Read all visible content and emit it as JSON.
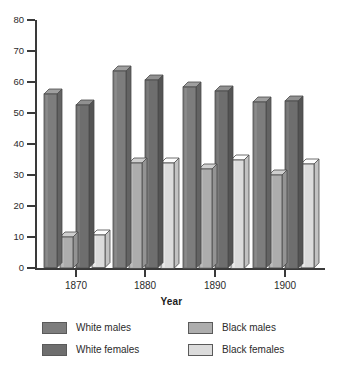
{
  "chart_data": {
    "type": "bar",
    "title": "",
    "subtitle": "",
    "xlabel": "Year",
    "ylabel": "",
    "categories": [
      "1870",
      "1880",
      "1890",
      "1900"
    ],
    "ylim": [
      0,
      80
    ],
    "yticks": [
      0,
      10,
      20,
      30,
      40,
      50,
      60,
      70,
      80
    ],
    "ytick_labels": [
      "0",
      "10",
      "20",
      "30",
      "40",
      "50",
      "60",
      "70",
      "80"
    ],
    "grid": false,
    "legend_position": "bottom",
    "series": [
      {
        "name": "White males",
        "color": "#7d7d7d",
        "values": [
          56.0,
          63.5,
          58.5,
          53.5
        ]
      },
      {
        "name": "Black males",
        "color": "#adadad",
        "values": [
          10.0,
          34.0,
          32.0,
          30.0
        ]
      },
      {
        "name": "White females",
        "color": "#6e6e6e",
        "values": [
          52.5,
          60.5,
          57.0,
          54.0
        ]
      },
      {
        "name": "Black females",
        "color": "#dcdcdc",
        "values": [
          10.5,
          34.0,
          35.0,
          33.5
        ]
      }
    ]
  },
  "axes": {
    "x_title": "Year",
    "x_tick_labels": [
      "1870",
      "1880",
      "1890",
      "1900"
    ],
    "y_tick_labels": [
      "80",
      "70",
      "60",
      "50",
      "40",
      "30",
      "20",
      "10",
      "0"
    ]
  },
  "legend": {
    "items": [
      {
        "label": "White males",
        "color": "#7d7d7d"
      },
      {
        "label": "White females",
        "color": "#6e6e6e"
      },
      {
        "label": "Black males",
        "color": "#adadad"
      },
      {
        "label": "Black females",
        "color": "#dcdcdc"
      }
    ]
  },
  "colors": {
    "axis": "#3a3a3a",
    "text": "#2b2b2b",
    "background": "#ffffff",
    "bar_outline": "#4a4a4a",
    "white_males": "#7d7d7d",
    "white_females": "#6e6e6e",
    "black_males": "#adadad",
    "black_females": "#dcdcdc"
  }
}
